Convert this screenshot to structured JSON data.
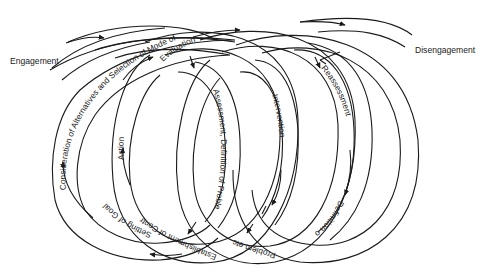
{
  "diagram": {
    "type": "helical process cycle",
    "colors": {
      "line": "#1a1a1a",
      "text": "#222222",
      "background": "#ffffff"
    },
    "endpoints": {
      "start": "Engagement",
      "end": "Disengagement"
    },
    "stages": [
      {
        "id": "consideration",
        "label": "Consideration of Alternatives and Selection of Mode of"
      },
      {
        "id": "evaluation",
        "label": "Evaluation"
      },
      {
        "id": "action",
        "label": "Action"
      },
      {
        "id": "setting-of-goal",
        "label": "Setting of Goal"
      },
      {
        "id": "establishment-of-contract",
        "label": "Establishment of Contract"
      },
      {
        "id": "assessment",
        "label": "Assessment, Definition of Problem"
      },
      {
        "id": "problem-etc",
        "label": "Problem etc. etc."
      },
      {
        "id": "intervention",
        "label": "Intervention"
      },
      {
        "id": "reassessment",
        "label": "Reassessment"
      },
      {
        "id": "definition-of",
        "label": "Definition of"
      }
    ],
    "loop_count": 4
  }
}
